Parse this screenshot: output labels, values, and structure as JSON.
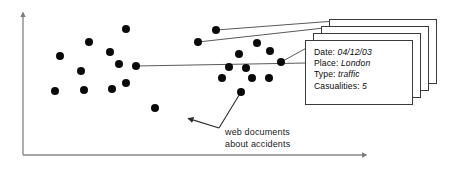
{
  "figure": {
    "type": "scatter-annotation-diagram",
    "background_color": "#ffffff",
    "width": 461,
    "height": 172,
    "axis": {
      "color": "#8a8a8a",
      "x_axis": {
        "x1": 23,
        "y1": 155,
        "x2": 366,
        "y2": 155,
        "arrow": true
      },
      "y_axis": {
        "x1": 23,
        "y1": 155,
        "x2": 23,
        "y2": 13,
        "arrow": true
      }
    },
    "dot_color": "#0a0a0a",
    "dot_radius": 4.0,
    "leader_line_color": "#5a5a5a"
  },
  "points": {
    "left_cluster": [
      {
        "x": 89,
        "y": 42
      },
      {
        "x": 126,
        "y": 29
      },
      {
        "x": 60,
        "y": 56
      },
      {
        "x": 81,
        "y": 71
      },
      {
        "x": 110,
        "y": 52
      },
      {
        "x": 136,
        "y": 66
      },
      {
        "x": 119,
        "y": 64
      },
      {
        "x": 55,
        "y": 91
      },
      {
        "x": 84,
        "y": 90
      },
      {
        "x": 112,
        "y": 89
      },
      {
        "x": 126,
        "y": 83
      },
      {
        "x": 155,
        "y": 108
      }
    ],
    "right_cluster": [
      {
        "x": 216,
        "y": 30
      },
      {
        "x": 198,
        "y": 42
      },
      {
        "x": 257,
        "y": 43
      },
      {
        "x": 239,
        "y": 54
      },
      {
        "x": 229,
        "y": 67
      },
      {
        "x": 270,
        "y": 51
      },
      {
        "x": 281,
        "y": 62
      },
      {
        "x": 246,
        "y": 68
      },
      {
        "x": 222,
        "y": 78
      },
      {
        "x": 252,
        "y": 78
      },
      {
        "x": 269,
        "y": 78
      },
      {
        "x": 241,
        "y": 92
      }
    ]
  },
  "leader_lines": [
    {
      "name": "dot-to-card-back",
      "x1": 216,
      "y1": 30,
      "x2": 335,
      "y2": 21
    },
    {
      "name": "dot-to-card-third",
      "x1": 198,
      "y1": 42,
      "x2": 333,
      "y2": 27
    },
    {
      "name": "dot-to-card-second",
      "x1": 281,
      "y1": 62,
      "x2": 334,
      "y2": 33
    },
    {
      "name": "dot-to-card-front",
      "x1": 136,
      "y1": 66,
      "x2": 306,
      "y2": 63
    }
  ],
  "pointer": {
    "name": "web-documents-pointer",
    "from_dot": {
      "x": 241,
      "y": 92
    },
    "vertex": {
      "x": 219,
      "y": 128
    },
    "arrow_tip": {
      "x": 183,
      "y": 117
    }
  },
  "cards": {
    "count": 4,
    "stack_offset_x": 8,
    "stack_offset_y": 7,
    "front": {
      "x": 305,
      "y": 40,
      "width": 108,
      "height": 65
    },
    "record": {
      "fields": [
        {
          "label": "Date:",
          "value": "04/12/03"
        },
        {
          "label": "Place:",
          "value": "London"
        },
        {
          "label": "Type:",
          "value": "traffic"
        },
        {
          "label": "Casualities:",
          "value": "5"
        }
      ]
    }
  },
  "caption": {
    "line1": "web documents",
    "line2": "about accidents",
    "x": 225,
    "y": 127
  }
}
